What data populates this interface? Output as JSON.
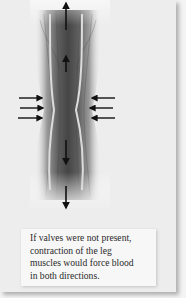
{
  "figure": {
    "colors": {
      "background": "#ededed",
      "muscle_dark": "#4a4a4a",
      "muscle_mid": "#7a7a7a",
      "vein_wall": "#d8d8d8",
      "arrow": "#111111"
    },
    "arrows": {
      "squeeze_from_left": 3,
      "squeeze_from_right": 3,
      "blood_flow_up": 2,
      "blood_flow_down": 2
    },
    "icons": {
      "squeeze_left": "arrow-right-icon",
      "squeeze_right": "arrow-left-icon",
      "flow_up": "arrow-up-icon",
      "flow_down": "arrow-down-icon"
    }
  },
  "caption": {
    "lines": [
      "If valves were not present,",
      "contraction of the leg",
      "muscles would force blood",
      "in both directions."
    ]
  }
}
